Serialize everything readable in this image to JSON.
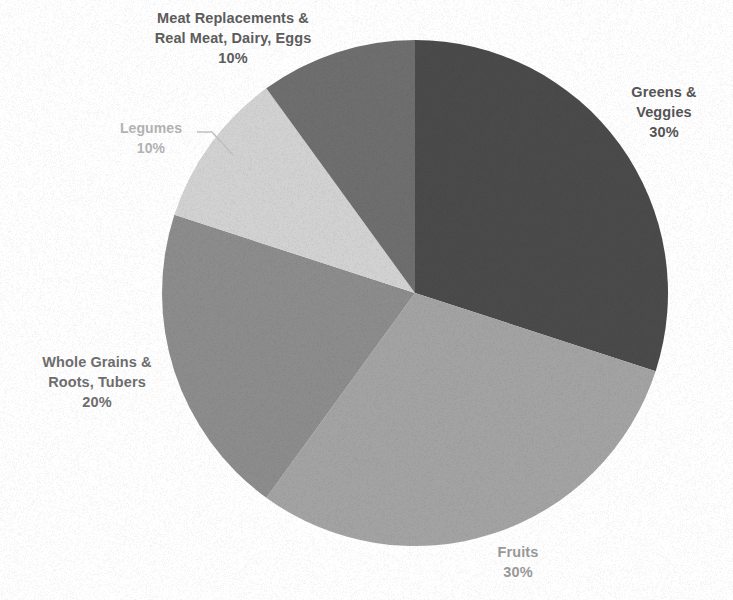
{
  "chart_data": {
    "type": "pie",
    "title": "",
    "categories": [
      "Greens & Veggies",
      "Fruits",
      "Whole Grains & Roots, Tubers",
      "Legumes",
      "Meat Replacements & Real Meat, Dairy, Eggs"
    ],
    "values": [
      30,
      30,
      20,
      10,
      10
    ],
    "value_unit": "%",
    "start_angle_deg": 0,
    "direction": "clockwise",
    "legend": "none",
    "grid": false,
    "slices": [
      {
        "name": "Greens & Veggies",
        "label_line1": "Greens &",
        "label_line2": "Veggies",
        "value": 30,
        "value_label": "30%",
        "color": "#4a4a4a",
        "label_color": "#555555",
        "start_deg": 0,
        "end_deg": 108
      },
      {
        "name": "Fruits",
        "label_line1": "Fruits",
        "label_line2": "",
        "value": 30,
        "value_label": "30%",
        "color": "#a3a3a3",
        "label_color": "#9a9a9a",
        "start_deg": 108,
        "end_deg": 216
      },
      {
        "name": "Whole Grains & Roots, Tubers",
        "label_line1": "Whole Grains &",
        "label_line2": "Roots, Tubers",
        "value": 20,
        "value_label": "20%",
        "color": "#8c8c8c",
        "label_color": "#6e6e6e",
        "start_deg": 216,
        "end_deg": 288
      },
      {
        "name": "Legumes",
        "label_line1": "Legumes",
        "label_line2": "",
        "value": 10,
        "value_label": "10%",
        "color": "#d2d2d2",
        "label_color": "#b4b4b4",
        "start_deg": 288,
        "end_deg": 324
      },
      {
        "name": "Meat Replacements & Real Meat, Dairy, Eggs",
        "label_line1": "Meat Replacements &",
        "label_line2": "Real Meat, Dairy, Eggs",
        "value": 10,
        "value_label": "10%",
        "color": "#6e6e6e",
        "label_color": "#5d5d5d",
        "start_deg": 324,
        "end_deg": 360
      }
    ],
    "geometry": {
      "center_x": 415,
      "center_y": 293,
      "radius": 253
    },
    "background_color": "#ffffff"
  }
}
